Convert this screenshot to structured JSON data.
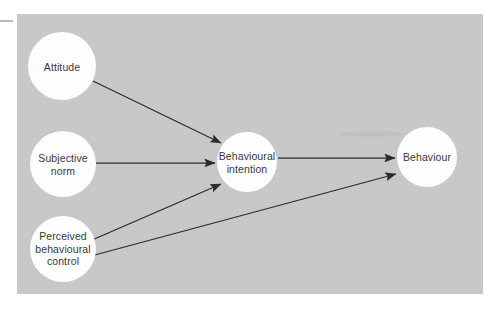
{
  "figure": {
    "background_color": "#ffffff",
    "panel_color": "#c8c8c8",
    "node_fill_color": "#fdfdfd",
    "line_color": "#2b2b2b",
    "text_color": "#3a3a3a"
  },
  "nodes": [
    {
      "id": "attitude",
      "label": "Attitude",
      "cx": 62,
      "cy": 66,
      "r": 34
    },
    {
      "id": "subjective-norm",
      "label": "Subjective\nnorm",
      "cx": 63,
      "cy": 164,
      "r": 33
    },
    {
      "id": "perceived-behavioural-control",
      "label": "Perceived\nbehavioural\ncontrol",
      "cx": 63,
      "cy": 249,
      "r": 33
    },
    {
      "id": "behavioural-intention",
      "label": "Behavioural\nintention",
      "cx": 247,
      "cy": 162,
      "r": 30
    },
    {
      "id": "behaviour",
      "label": "Behaviour",
      "cx": 427,
      "cy": 157,
      "r": 30
    }
  ],
  "edges": [
    {
      "id": "attitude-to-intention",
      "from": "Attitude",
      "to": "Behavioural intention",
      "x1": 93,
      "y1": 81,
      "x2": 221,
      "y2": 143
    },
    {
      "id": "subjective-norm-to-intention",
      "from": "Subjective norm",
      "to": "Behavioural intention",
      "x1": 96,
      "y1": 163,
      "x2": 215,
      "y2": 163
    },
    {
      "id": "pbc-to-intention",
      "from": "Perceived behavioural control",
      "to": "Behavioural intention",
      "x1": 92,
      "y1": 240,
      "x2": 221,
      "y2": 184
    },
    {
      "id": "intention-to-behaviour",
      "from": "Behavioural intention",
      "to": "Behaviour",
      "x1": 278,
      "y1": 158,
      "x2": 395,
      "y2": 158
    },
    {
      "id": "pbc-to-behaviour",
      "from": "Perceived behavioural control",
      "to": "Behaviour",
      "x1": 91,
      "y1": 256,
      "x2": 396,
      "y2": 174
    }
  ],
  "marks": {
    "left_dash_label": "left edge scan mark",
    "smudge_label": "scan smudge"
  }
}
